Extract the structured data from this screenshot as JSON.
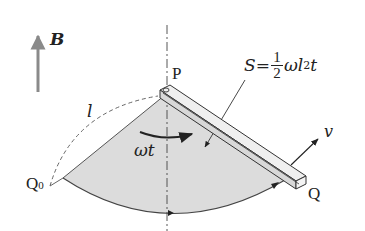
{
  "diagram": {
    "labels": {
      "field": "B",
      "pivot": "P",
      "start_point": "Q",
      "start_point_sub": "0",
      "end_point": "Q",
      "length": "l",
      "angle": "ωt",
      "velocity": "v",
      "area_lhs": "S=",
      "area_frac_num": "1",
      "area_frac_den": "2",
      "area_rhs_a": "ωl",
      "area_rhs_exp": "2",
      "area_rhs_b": "t"
    },
    "colors": {
      "sector_fill": "#dcdcdc",
      "field_arrow": "#8a8a8a",
      "stroke": "#333333",
      "rod_face": "#e6e6e6"
    }
  }
}
